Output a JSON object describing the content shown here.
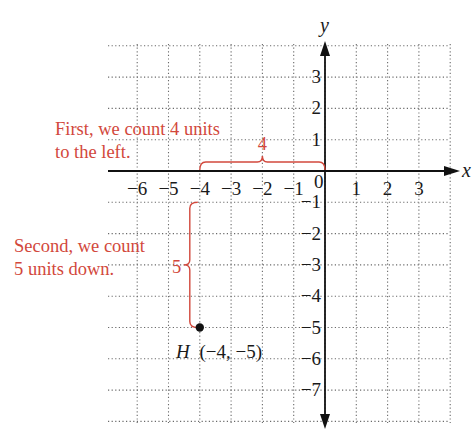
{
  "diagram": {
    "type": "coordinate-plane",
    "colors": {
      "axis": "#111111",
      "grid": "#6a6a6a",
      "annotation": "#d2483c",
      "point": "#111111"
    },
    "axes": {
      "x_label": "x",
      "y_label": "y",
      "x_range": [
        -7,
        4
      ],
      "y_range": [
        -8,
        4
      ],
      "x_ticks": [
        {
          "value": -6,
          "label": "−6"
        },
        {
          "value": -5,
          "label": "−5"
        },
        {
          "value": -4,
          "label": "−4"
        },
        {
          "value": -3,
          "label": "−3"
        },
        {
          "value": -2,
          "label": "−2"
        },
        {
          "value": -1,
          "label": "−1"
        },
        {
          "value": 1,
          "label": "1"
        },
        {
          "value": 2,
          "label": "2"
        },
        {
          "value": 3,
          "label": "3"
        }
      ],
      "origin_label": "0",
      "y_ticks": [
        {
          "value": 3,
          "label": "3"
        },
        {
          "value": 2,
          "label": "2"
        },
        {
          "value": 1,
          "label": "1"
        },
        {
          "value": -1,
          "label": "−1"
        },
        {
          "value": -2,
          "label": "−2"
        },
        {
          "value": -3,
          "label": "−3"
        },
        {
          "value": -4,
          "label": "−4"
        },
        {
          "value": -5,
          "label": "−5"
        },
        {
          "value": -6,
          "label": "−6"
        },
        {
          "value": -7,
          "label": "−7"
        }
      ]
    },
    "point": {
      "name": "H",
      "x": -4,
      "y": -5,
      "label_coords": "(−4, −5)"
    },
    "annotations": {
      "horizontal": {
        "brace_label": "4",
        "from_x": -4,
        "to_x": 0,
        "text_lines": [
          "First, we count 4 units",
          "to the left."
        ]
      },
      "vertical": {
        "brace_label": "5",
        "from_y": -1,
        "to_y": -5,
        "text_lines": [
          "Second, we count",
          "5 units down."
        ]
      }
    }
  }
}
